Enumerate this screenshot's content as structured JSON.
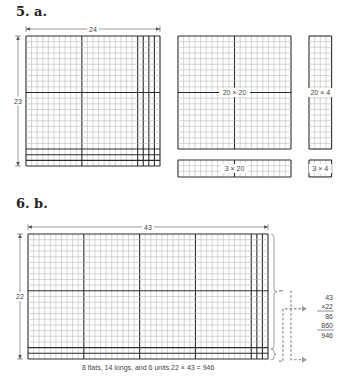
{
  "problem_a": {
    "heading": "5. a.",
    "grid": {
      "rows": 23,
      "cols": 24,
      "split_rows": [
        20,
        3
      ],
      "split_cols": [
        20,
        4
      ],
      "flat_size": 10
    },
    "width_label": "24",
    "height_label": "23",
    "pieces": [
      {
        "id": "20x20",
        "label": "20 × 20",
        "rows": 20,
        "cols": 20
      },
      {
        "id": "20x4",
        "label": "20 × 4",
        "rows": 20,
        "cols": 4
      },
      {
        "id": "3x20",
        "label": "3 × 20",
        "rows": 3,
        "cols": 20
      },
      {
        "id": "3x4",
        "label": "3 × 4",
        "rows": 3,
        "cols": 4
      }
    ]
  },
  "problem_b": {
    "heading": "6. b.",
    "grid": {
      "rows": 22,
      "cols": 43,
      "split_rows": [
        20,
        2
      ],
      "split_cols": [
        40,
        3
      ],
      "flat_size": 10
    },
    "width_label": "43",
    "height_label": "22",
    "multiplication": {
      "top": "43",
      "multiplier": "×22",
      "partial1": "86",
      "partial2": "860",
      "result": "946"
    },
    "caption": "8 flats, 14 longs, and 6 units  22 × 43 = 946"
  },
  "colors": {
    "grid_line": "#b8b8b8",
    "bold_line": "#2a2a2a",
    "arrow": "#999999"
  }
}
